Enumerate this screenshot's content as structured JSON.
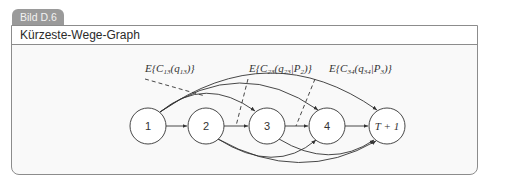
{
  "figure": {
    "tab_label": "Bild D.6",
    "title": "Kürzeste-Wege-Graph"
  },
  "graph": {
    "nodes": [
      {
        "id": "1",
        "label": "1"
      },
      {
        "id": "2",
        "label": "2"
      },
      {
        "id": "3",
        "label": "3"
      },
      {
        "id": "4",
        "label": "4"
      },
      {
        "id": "T+1",
        "label": "T + 1"
      }
    ],
    "edges": [
      {
        "from": "1",
        "to": "2"
      },
      {
        "from": "1",
        "to": "3"
      },
      {
        "from": "1",
        "to": "4"
      },
      {
        "from": "1",
        "to": "T+1"
      },
      {
        "from": "2",
        "to": "3"
      },
      {
        "from": "2",
        "to": "4"
      },
      {
        "from": "2",
        "to": "T+1"
      },
      {
        "from": "3",
        "to": "4"
      },
      {
        "from": "3",
        "to": "T+1"
      },
      {
        "from": "4",
        "to": "T+1"
      }
    ],
    "annotations": [
      {
        "text": "E{C13(q13)}",
        "points_to_edge": "1-3"
      },
      {
        "text": "E{C23(q23|P2)}",
        "points_to_edge": "2-3"
      },
      {
        "text": "E{C34(q34|P3)}",
        "points_to_edge": "3-4"
      }
    ]
  }
}
